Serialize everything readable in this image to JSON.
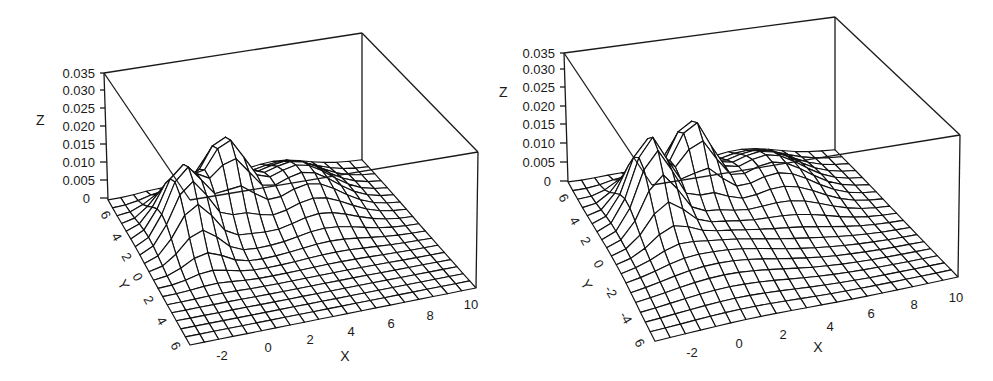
{
  "chart_data": [
    {
      "type": "surface3d",
      "title": "",
      "xlabel": "X",
      "ylabel": "Y",
      "zlabel": "Z",
      "xlim": [
        -3,
        10
      ],
      "ylim": [
        -6,
        6
      ],
      "zlim": [
        0,
        0.035
      ],
      "x_ticks": [
        "-2",
        "0",
        "2",
        "4",
        "6",
        "8",
        "10"
      ],
      "y_ticks": [
        "6",
        "4",
        "2",
        "0",
        "2",
        "4",
        "6"
      ],
      "z_ticks": [
        "0",
        "0.005",
        "0.010",
        "0.015",
        "0.020",
        "0.025",
        "0.030",
        "0.035"
      ],
      "grid": false,
      "wireframe": true,
      "peaks": [
        {
          "x": -0.5,
          "y": 2.0,
          "z": 0.02,
          "sx": 0.9,
          "sy": 1.6
        },
        {
          "x": 2.0,
          "y": 3.5,
          "z": 0.02,
          "sx": 0.9,
          "sy": 1.4
        },
        {
          "x": 5.5,
          "y": 3.0,
          "z": 0.011,
          "sx": 1.6,
          "sy": 2.0
        }
      ]
    },
    {
      "type": "surface3d",
      "title": "",
      "xlabel": "X",
      "ylabel": "Y",
      "zlabel": "Z",
      "xlim": [
        -3,
        10
      ],
      "ylim": [
        -6,
        6
      ],
      "zlim": [
        0,
        0.035
      ],
      "x_ticks": [
        "-2",
        "0",
        "2",
        "4",
        "6",
        "8",
        "10"
      ],
      "y_ticks": [
        "6",
        "4",
        "2",
        "0",
        "-2",
        "-4",
        "6"
      ],
      "z_ticks": [
        "0",
        "0.005",
        "0.010",
        "0.015",
        "0.020",
        "0.025",
        "0.030",
        "0.035"
      ],
      "grid": false,
      "wireframe": true,
      "peaks": [
        {
          "x": -0.5,
          "y": 2.0,
          "z": 0.022,
          "sx": 0.8,
          "sy": 1.5
        },
        {
          "x": 2.0,
          "y": 3.5,
          "z": 0.02,
          "sx": 0.8,
          "sy": 1.3
        },
        {
          "x": 1.0,
          "y": -1.0,
          "z": 0.006,
          "sx": 2.5,
          "sy": 2.5
        },
        {
          "x": 5.5,
          "y": 3.0,
          "z": 0.01,
          "sx": 1.6,
          "sy": 2.0
        }
      ]
    }
  ],
  "plots": [
    {
      "z_label": "Z",
      "x_label": "X",
      "y_label": "Y",
      "z_ticks": [
        "0",
        "0.005",
        "0.010",
        "0.015",
        "0.020",
        "0.025",
        "0.030",
        "0.035"
      ],
      "x_ticks": [
        "-2",
        "0",
        "2",
        "4",
        "6",
        "8",
        "10"
      ],
      "y_ticks": [
        "6",
        "4",
        "2",
        "0",
        "2",
        "4",
        "6"
      ]
    },
    {
      "z_label": "Z",
      "x_label": "X",
      "y_label": "Y",
      "z_ticks": [
        "0",
        "0.005",
        "0.010",
        "0.015",
        "0.020",
        "0.025",
        "0.030",
        "0.035"
      ],
      "x_ticks": [
        "-2",
        "0",
        "2",
        "4",
        "6",
        "8",
        "10"
      ],
      "y_ticks": [
        "6",
        "4",
        "2",
        "0",
        "-2",
        "-4",
        "6"
      ]
    }
  ]
}
